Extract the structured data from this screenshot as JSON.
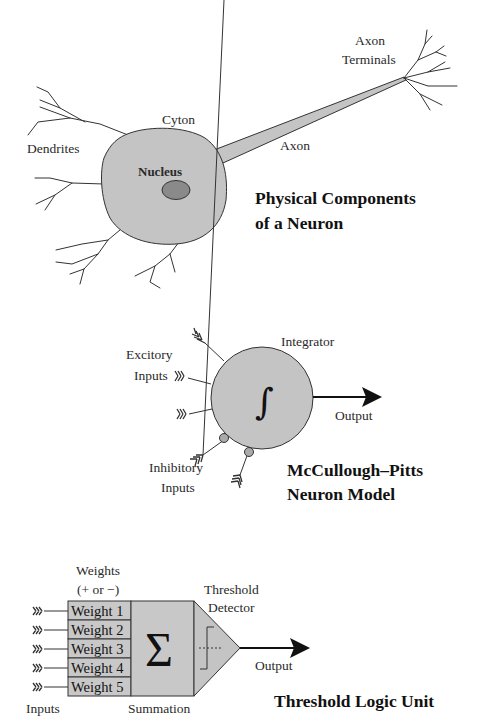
{
  "neuron": {
    "title_line1": "Physical Components",
    "title_line2": "of a Neuron",
    "labels": {
      "dendrites": "Dendrites",
      "cyton": "Cyton",
      "nucleus": "Nucleus",
      "axon": "Axon",
      "axon_terminals_line1": "Axon",
      "axon_terminals_line2": "Terminals"
    }
  },
  "mcculloch_pitts": {
    "title_line1": "McCullough–Pitts",
    "title_line2": "Neuron Model",
    "labels": {
      "integrator": "Integrator",
      "excitory_line1": "Excitory",
      "excitory_line2": "Inputs",
      "inhibitory_line1": "Inhibitory",
      "inhibitory_line2": "Inputs",
      "output": "Output",
      "integral_symbol": "∫"
    }
  },
  "tlu": {
    "title": "Threshold Logic Unit",
    "labels": {
      "weights_line1": "Weights",
      "weights_line2": "(+ or −)",
      "threshold_line1": "Threshold",
      "threshold_line2": "Detector",
      "output": "Output",
      "inputs": "Inputs",
      "summation": "Summation",
      "sigma_symbol": "Σ"
    },
    "weights": [
      "Weight 1",
      "Weight 2",
      "Weight 3",
      "Weight 4",
      "Weight 5"
    ]
  },
  "colors": {
    "cell_fill": "#c4c4c4",
    "nucleus_fill": "#8a8a8a",
    "stroke": "#333333",
    "background": "#ffffff"
  }
}
